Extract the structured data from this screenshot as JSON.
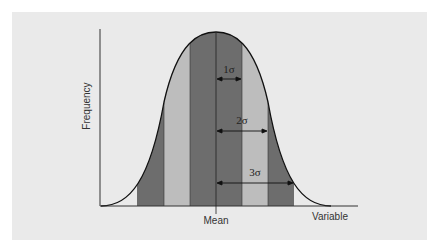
{
  "diagram": {
    "y_axis_label": "Frequency",
    "x_axis_label": "Variable",
    "mean_label": "Mean",
    "sigma_labels": [
      "1σ",
      "2σ",
      "3σ"
    ],
    "colors": {
      "background": "#eaeaea",
      "dark_band": "#6d6d6d",
      "light_band": "#bdbdbd",
      "axis": "#333333",
      "curve": "#111111"
    }
  }
}
